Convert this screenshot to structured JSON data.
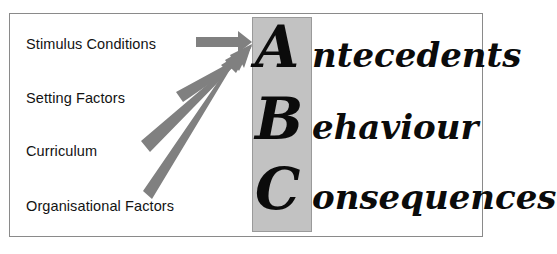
{
  "diagram": {
    "background_color": "#ffffff",
    "frame_color": "#8a8a8a",
    "band_color": "#c2c2c2",
    "arrow_color": "#808080",
    "text_color": "#131313"
  },
  "inputs": [
    {
      "label": "Stimulus Conditions"
    },
    {
      "label": "Setting Factors"
    },
    {
      "label": "Curriculum"
    },
    {
      "label": "Organisational Factors"
    }
  ],
  "abc": [
    {
      "initial": "A",
      "rest": "ntecedents",
      "full": "Antecedents"
    },
    {
      "initial": "B",
      "rest": "ehaviour",
      "full": "Behaviour"
    },
    {
      "initial": "C",
      "rest": "onsequences",
      "full": "Consequences"
    }
  ],
  "arrows": [
    {
      "name": "arrow-stimulus-conditions",
      "from": "Stimulus Conditions",
      "to": "Antecedents"
    },
    {
      "name": "arrow-setting-factors",
      "from": "Setting Factors",
      "to": "Antecedents"
    },
    {
      "name": "arrow-curriculum",
      "from": "Curriculum",
      "to": "Antecedents"
    },
    {
      "name": "arrow-organisational-factors",
      "from": "Organisational Factors",
      "to": "Antecedents"
    }
  ]
}
